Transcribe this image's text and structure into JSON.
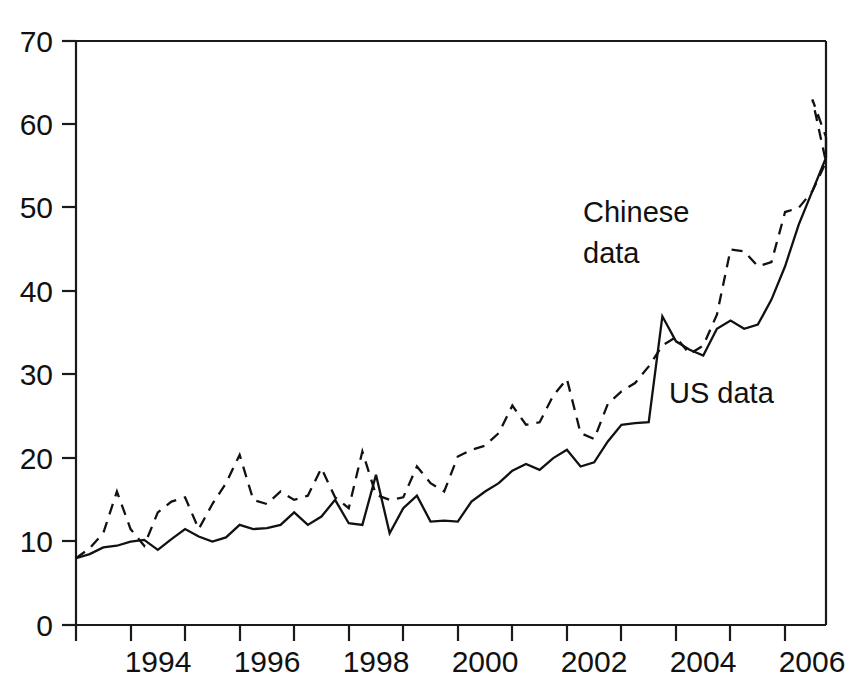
{
  "chart_data": {
    "type": "line",
    "title": "",
    "subtitle": "",
    "xlabel": "",
    "ylabel": "",
    "xlim": [
      1993.0,
      2006.75
    ],
    "ylim": [
      0,
      70
    ],
    "grid": false,
    "legend_position": "inline-annotations",
    "y_ticks": [
      0,
      10,
      20,
      30,
      40,
      50,
      60,
      70
    ],
    "y_tick_labels": [
      "0",
      "10",
      "20",
      "30",
      "40",
      "50",
      "60",
      "70"
    ],
    "x_ticks": [
      1993,
      1994,
      1995,
      1996,
      1997,
      1998,
      1999,
      2000,
      2001,
      2002,
      2003,
      2004,
      2005,
      2006
    ],
    "x_tick_labels_shown": [
      "1994",
      "1996",
      "1998",
      "2000",
      "2002",
      "2004",
      "2006"
    ],
    "x_minor_ticks_unlabeled": [
      1993,
      1995,
      1997,
      1999,
      2001,
      2003,
      2005
    ],
    "x_values": [
      1993.0,
      1993.25,
      1993.5,
      1993.75,
      1994.0,
      1994.25,
      1994.5,
      1994.75,
      1995.0,
      1995.25,
      1995.5,
      1995.75,
      1996.0,
      1996.25,
      1996.5,
      1996.75,
      1997.0,
      1997.25,
      1997.5,
      1997.75,
      1998.0,
      1998.25,
      1998.5,
      1998.75,
      1999.0,
      1999.25,
      1999.5,
      1999.75,
      2000.0,
      2000.25,
      2000.5,
      2000.75,
      2001.0,
      2001.25,
      2001.5,
      2001.75,
      2002.0,
      2002.25,
      2002.5,
      2002.75,
      2003.0,
      2003.25,
      2003.5,
      2003.75,
      2004.0,
      2004.25,
      2004.5,
      2004.75,
      2005.0,
      2005.25,
      2005.5,
      2005.75,
      2006.0,
      2006.25,
      2006.5,
      2006.75
    ],
    "series": [
      {
        "name": "Chinese data",
        "label": "Chinese data",
        "style": "dashed",
        "color": "#111111",
        "values": [
          8.0,
          9.2,
          11.0,
          16.0,
          11.5,
          9.5,
          13.5,
          14.8,
          15.3,
          11.5,
          14.5,
          17.0,
          20.4,
          15.0,
          14.5,
          16.0,
          15.0,
          15.5,
          18.8,
          15.3,
          14.0,
          20.8,
          15.6,
          15.0,
          15.3,
          19.0,
          17.0,
          16.0,
          20.2,
          21.0,
          21.5,
          23.0,
          26.3,
          24.0,
          24.3,
          27.5,
          29.5,
          23.0,
          22.3,
          26.5,
          28.0,
          29.0,
          31.0,
          33.5,
          34.5,
          32.5,
          33.5,
          37.2,
          45.0,
          44.8,
          43.0,
          43.5,
          49.5,
          50.0,
          52.0,
          55.5
        ]
      },
      {
        "name": "US data",
        "label": "US data",
        "style": "solid",
        "color": "#111111",
        "values": [
          8.0,
          8.5,
          9.3,
          9.5,
          10.0,
          10.2,
          9.0,
          10.3,
          11.5,
          10.6,
          10.0,
          10.5,
          12.0,
          11.5,
          11.6,
          12.0,
          13.5,
          12.0,
          13.0,
          15.0,
          12.2,
          12.0,
          18.0,
          11.0,
          14.0,
          15.5,
          12.4,
          12.5,
          12.4,
          14.8,
          16.0,
          17.0,
          18.5,
          19.3,
          18.6,
          20.0,
          21.0,
          19.0,
          19.5,
          22.0,
          24.0,
          24.2,
          24.3,
          37.0,
          34.0,
          33.0,
          32.3,
          35.5,
          36.5,
          35.5,
          36.0,
          39.0,
          43.0,
          48.0,
          52.0,
          56.0
        ]
      }
    ],
    "series_extra_points": {
      "Chinese data": {
        "note": "dashed line rises steeply from 37.2 at 2003.75 to 45.0 at 2004.0, peaks at 63.0 at 2006.5, ends 58.5 at 2006.75",
        "peak_value": 63.0,
        "end_value": 58.5
      },
      "US data": {
        "note": "solid line sharp spike to 37.0 at 2003.75 then drops to 34.0, ends at 58.5 at 2006.75",
        "spike_value": 37.0,
        "end_value": 58.5
      }
    },
    "annotations": [
      {
        "text_line1": "Chinese",
        "text_line2": "data",
        "x": 2004.0,
        "y": 52.0
      },
      {
        "text_line1": "US data",
        "text_line2": "",
        "x": 2005.0,
        "y": 28.0
      }
    ]
  },
  "axis": {
    "y_label_0": "0",
    "y_label_10": "10",
    "y_label_20": "20",
    "y_label_30": "30",
    "y_label_40": "40",
    "y_label_50": "50",
    "y_label_60": "60",
    "y_label_70": "70",
    "x_label_1994": "1994",
    "x_label_1996": "1996",
    "x_label_1998": "1998",
    "x_label_2000": "2000",
    "x_label_2002": "2002",
    "x_label_2004": "2004",
    "x_label_2006": "2006"
  },
  "labels": {
    "chinese_line1": "Chinese",
    "chinese_line2": "data",
    "us": "US data"
  }
}
